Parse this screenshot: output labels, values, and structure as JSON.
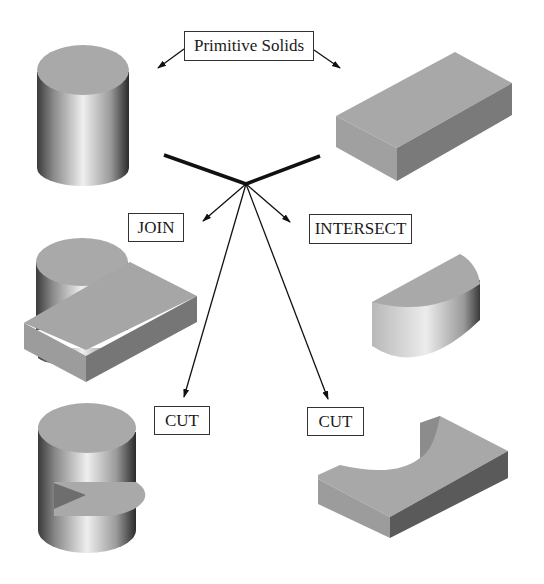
{
  "diagram": {
    "title_label": "Primitive Solids",
    "operations": {
      "join": "JOIN",
      "intersect": "INTERSECT",
      "cut_left": "CUT",
      "cut_right": "CUT"
    },
    "solids": [
      {
        "id": "cylinder",
        "role": "primitive"
      },
      {
        "id": "block",
        "role": "primitive"
      },
      {
        "id": "joined-solid",
        "role": "result-join"
      },
      {
        "id": "intersected-solid",
        "role": "result-intersect"
      },
      {
        "id": "cut-cylinder",
        "role": "result-cut-cylinder-minus-block"
      },
      {
        "id": "cut-block",
        "role": "result-cut-block-minus-cylinder"
      }
    ],
    "colors": {
      "face_top": "#a8a8a8",
      "face_side_dark": "#6e6e6e",
      "face_front": "#9a9a9a",
      "line": "#111111"
    }
  }
}
